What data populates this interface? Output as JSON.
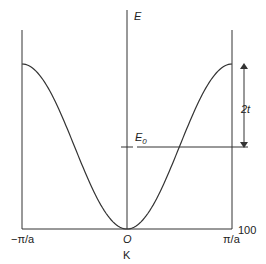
{
  "diagram": {
    "title": "",
    "function": "E = E0 - 2t cos(ka)",
    "labels": {
      "energy_axis": "E",
      "reference_energy": "E",
      "reference_energy_sub": "0",
      "bandwidth_half": "2t",
      "k_left": "−π/a",
      "k_origin": "O",
      "k_right": "π/a",
      "k_axis": "K",
      "corner_number": "100"
    }
  }
}
